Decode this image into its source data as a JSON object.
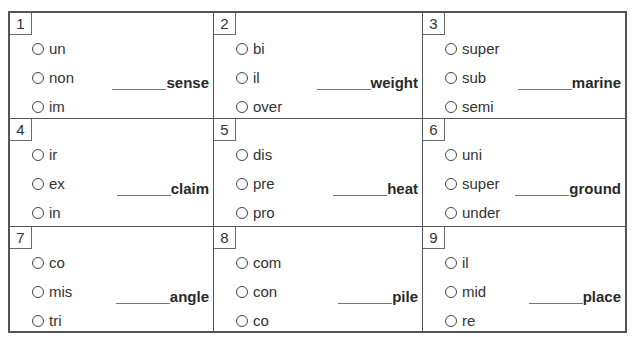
{
  "worksheet": {
    "items": [
      {
        "number": "1",
        "options": [
          "un",
          "non",
          "im"
        ],
        "blank": "______",
        "word": "sense"
      },
      {
        "number": "2",
        "options": [
          "bi",
          "il",
          "over"
        ],
        "blank": "______",
        "word": "weight"
      },
      {
        "number": "3",
        "options": [
          "super",
          "sub",
          "semi"
        ],
        "blank": "______",
        "word": "marine"
      },
      {
        "number": "4",
        "options": [
          "ir",
          "ex",
          "in"
        ],
        "blank": "______",
        "word": "claim"
      },
      {
        "number": "5",
        "options": [
          "dis",
          "pre",
          "pro"
        ],
        "blank": "______",
        "word": "heat"
      },
      {
        "number": "6",
        "options": [
          "uni",
          "super",
          "under"
        ],
        "blank": "______",
        "word": "ground"
      },
      {
        "number": "7",
        "options": [
          "co",
          "mis",
          "tri"
        ],
        "blank": "______",
        "word": "angle"
      },
      {
        "number": "8",
        "options": [
          "com",
          "con",
          "co"
        ],
        "blank": "______",
        "word": "pile"
      },
      {
        "number": "9",
        "options": [
          "il",
          "mid",
          "re"
        ],
        "blank": "______",
        "word": "place"
      }
    ]
  },
  "icons": {
    "radio": "empty-circle"
  },
  "colors": {
    "border": "#555555",
    "text": "#2a2a2a",
    "background": "#ffffff"
  }
}
